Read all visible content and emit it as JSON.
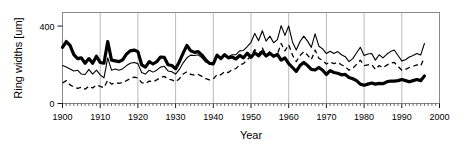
{
  "chart_data": {
    "type": "line",
    "title": "",
    "xlabel": "Year",
    "ylabel": "Ring widths [um]",
    "xlim": [
      1900,
      2000
    ],
    "ylim": [
      0,
      470
    ],
    "yticks": [
      0,
      400
    ],
    "ytick_labels": [
      "0",
      "400"
    ],
    "xticks": [
      1900,
      1910,
      1920,
      1930,
      1940,
      1950,
      1960,
      1970,
      1980,
      1990,
      2000
    ],
    "xtick_labels": [
      "1900",
      "1910",
      "1920",
      "1930",
      "1940",
      "1950",
      "1960",
      "1970",
      "1980",
      "1990",
      "2000"
    ],
    "grid": "vertical-only",
    "legend": "none",
    "minor_ticks": "x-axis, yearly",
    "x": [
      1900,
      1901,
      1902,
      1903,
      1904,
      1905,
      1906,
      1907,
      1908,
      1909,
      1910,
      1911,
      1912,
      1913,
      1914,
      1915,
      1916,
      1917,
      1918,
      1919,
      1920,
      1921,
      1922,
      1923,
      1924,
      1925,
      1926,
      1927,
      1928,
      1929,
      1930,
      1931,
      1932,
      1933,
      1934,
      1935,
      1936,
      1937,
      1938,
      1939,
      1940,
      1941,
      1942,
      1943,
      1944,
      1945,
      1946,
      1947,
      1948,
      1949,
      1950,
      1951,
      1952,
      1953,
      1954,
      1955,
      1956,
      1957,
      1958,
      1959,
      1960,
      1961,
      1962,
      1963,
      1964,
      1965,
      1966,
      1967,
      1968,
      1969,
      1970,
      1971,
      1972,
      1973,
      1974,
      1975,
      1976,
      1977,
      1978,
      1979,
      1980,
      1981,
      1982,
      1983,
      1984,
      1985,
      1986,
      1987,
      1988,
      1989,
      1990,
      1991,
      1992,
      1993,
      1994,
      1995,
      1996
    ],
    "series": [
      {
        "name": "thick-solid",
        "style": "solid-thick",
        "color": "#000000",
        "linewidth": 3.2,
        "values": [
          290,
          320,
          300,
          252,
          232,
          236,
          208,
          232,
          208,
          244,
          212,
          208,
          320,
          224,
          220,
          216,
          226,
          256,
          272,
          276,
          268,
          200,
          188,
          216,
          204,
          216,
          240,
          238,
          200,
          196,
          180,
          216,
          260,
          300,
          272,
          264,
          268,
          250,
          225,
          207,
          205,
          250,
          232,
          252,
          236,
          240,
          230,
          248,
          236,
          260,
          238,
          262,
          246,
          268,
          245,
          260,
          244,
          253,
          224,
          236,
          206,
          186,
          166,
          196,
          212,
          196,
          176,
          173,
          186,
          172,
          150,
          170,
          160,
          156,
          148,
          150,
          134,
          128,
          118,
          100,
          94,
          100,
          106,
          100,
          104,
          102,
          112,
          116,
          116,
          118,
          124,
          118,
          112,
          118,
          124,
          118,
          142
        ]
      },
      {
        "name": "thin-solid",
        "style": "solid-thin",
        "color": "#000000",
        "linewidth": 1.1,
        "values": [
          196,
          188,
          178,
          168,
          172,
          152,
          150,
          176,
          152,
          172,
          148,
          132,
          236,
          172,
          178,
          172,
          180,
          196,
          208,
          212,
          206,
          160,
          152,
          172,
          162,
          172,
          188,
          192,
          168,
          164,
          152,
          176,
          210,
          236,
          250,
          248,
          252,
          236,
          214,
          206,
          210,
          248,
          236,
          250,
          242,
          252,
          252,
          272,
          274,
          294,
          316,
          362,
          324,
          376,
          322,
          348,
          314,
          330,
          402,
          352,
          400,
          318,
          276,
          320,
          348,
          322,
          290,
          360,
          296,
          282,
          258,
          270,
          258,
          268,
          252,
          242,
          216,
          232,
          262,
          290,
          248,
          256,
          258,
          224,
          252,
          236,
          254,
          268,
          276,
          248,
          220,
          226,
          240,
          248,
          258,
          250,
          310
        ]
      },
      {
        "name": "dashed",
        "style": "dashed",
        "color": "#000000",
        "linewidth": 1.3,
        "values": [
          106,
          118,
          96,
          86,
          78,
          84,
          74,
          90,
          80,
          96,
          88,
          82,
          120,
          100,
          108,
          104,
          110,
          118,
          130,
          136,
          132,
          108,
          102,
          116,
          112,
          122,
          134,
          140,
          126,
          122,
          112,
          128,
          152,
          164,
          150,
          146,
          150,
          140,
          128,
          122,
          126,
          150,
          148,
          164,
          160,
          176,
          180,
          200,
          206,
          226,
          246,
          278,
          252,
          286,
          250,
          268,
          244,
          254,
          310,
          272,
          304,
          250,
          216,
          248,
          268,
          250,
          226,
          276,
          234,
          222,
          204,
          214,
          206,
          212,
          200,
          190,
          172,
          182,
          202,
          224,
          196,
          200,
          202,
          176,
          196,
          184,
          198,
          208,
          212,
          192,
          172,
          176,
          186,
          192,
          200,
          194,
          238
        ]
      }
    ]
  },
  "axes": {
    "y_label_text": "Ring widths [um]",
    "x_label_text": "Year"
  }
}
